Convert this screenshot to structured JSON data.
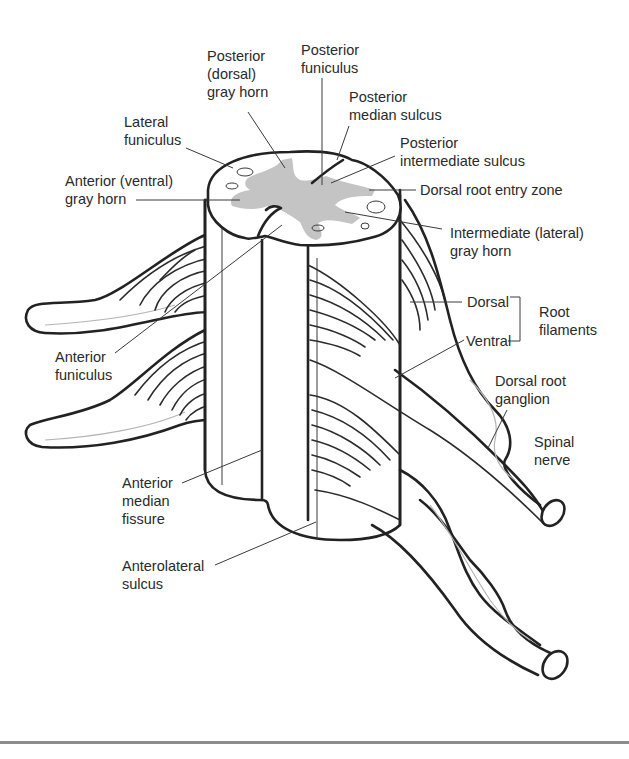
{
  "diagram": {
    "colors": {
      "outline": "#222222",
      "gray_matter": "#c4c4c4",
      "leader_line": "#3a3a3a",
      "bottom_rule": "#8c8c8c",
      "background": "#ffffff"
    },
    "labels": {
      "posterior_dorsal_gray_horn": [
        "Posterior",
        "(dorsal)",
        "gray horn"
      ],
      "posterior_funiculus": [
        "Posterior",
        "funiculus"
      ],
      "posterior_median_sulcus": [
        "Posterior",
        "median sulcus"
      ],
      "lateral_funiculus": [
        "Lateral",
        "funiculus"
      ],
      "posterior_intermediate_sulcus": [
        "Posterior",
        "intermediate sulcus"
      ],
      "anterior_ventral_gray_horn": [
        "Anterior (ventral)",
        "gray horn"
      ],
      "dorsal_root_entry_zone": [
        "Dorsal root entry zone"
      ],
      "intermediate_lateral_gray_horn": [
        "Intermediate (lateral)",
        "gray horn"
      ],
      "dorsal": [
        "Dorsal"
      ],
      "ventral": [
        "Ventral"
      ],
      "root_filaments": [
        "Root",
        "filaments"
      ],
      "anterior_funiculus": [
        "Anterior",
        "funiculus"
      ],
      "dorsal_root_ganglion": [
        "Dorsal root",
        "ganglion"
      ],
      "spinal_nerve": [
        "Spinal",
        "nerve"
      ],
      "anterior_median_fissure": [
        "Anterior",
        "median",
        "fissure"
      ],
      "anterolateral_sulcus": [
        "Anterolateral",
        "sulcus"
      ]
    }
  }
}
